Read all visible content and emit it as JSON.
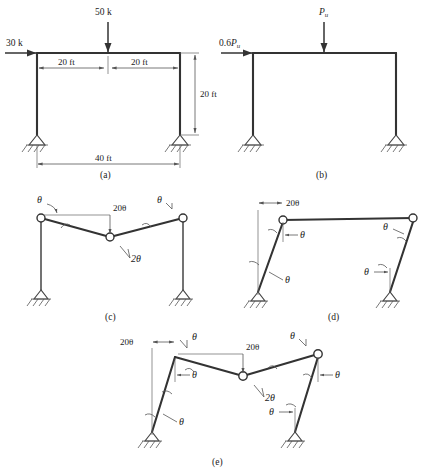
{
  "figure": {
    "background_color": "#ffffff",
    "line_color": "#333333",
    "panels": [
      {
        "id": "a",
        "caption": "(a)",
        "description": "Portal frame with factored service loads",
        "loads": [
          {
            "name": "horizontal-load",
            "label": "30 k",
            "direction": "right"
          },
          {
            "name": "vertical-load",
            "label": "50 k",
            "direction": "down"
          }
        ],
        "dimensions": [
          {
            "name": "left-span",
            "label": "20 ft"
          },
          {
            "name": "right-span",
            "label": "20 ft"
          },
          {
            "name": "column-height",
            "label": "20 ft"
          },
          {
            "name": "total-span",
            "label": "40 ft"
          }
        ],
        "supports": [
          "pinned",
          "pinned"
        ]
      },
      {
        "id": "b",
        "caption": "(b)",
        "description": "Portal frame with ultimate load Pu",
        "loads": [
          {
            "name": "horizontal-load",
            "label_prefix": "0.6",
            "label_symbol": "P",
            "label_sub": "u",
            "direction": "right"
          },
          {
            "name": "vertical-load",
            "label_prefix": "",
            "label_symbol": "P",
            "label_sub": "u",
            "direction": "down"
          }
        ],
        "supports": [
          "pinned",
          "pinned"
        ]
      },
      {
        "id": "c",
        "caption": "(c)",
        "description": "Beam mechanism",
        "angles": [
          {
            "name": "beam-left-rotation",
            "label": "θ"
          },
          {
            "name": "beam-displacement",
            "label": "20θ"
          },
          {
            "name": "beam-right-rotation",
            "label": "θ"
          },
          {
            "name": "beam-center-rotation",
            "label": "2θ"
          }
        ],
        "supports": [
          "pinned",
          "pinned"
        ]
      },
      {
        "id": "d",
        "caption": "(d)",
        "description": "Sway mechanism",
        "angles": [
          {
            "name": "sway-displacement",
            "label": "20θ"
          },
          {
            "name": "left-top-rotation",
            "label": "θ"
          },
          {
            "name": "left-base-rotation",
            "label": "θ"
          },
          {
            "name": "right-top-rotation",
            "label": "θ"
          },
          {
            "name": "right-base-rotation",
            "label": "θ"
          }
        ],
        "supports": [
          "pinned",
          "pinned"
        ]
      },
      {
        "id": "e",
        "caption": "(e)",
        "description": "Combined mechanism",
        "angles": [
          {
            "name": "sway-displacement",
            "label": "20θ"
          },
          {
            "name": "left-joint-rotation",
            "label": "θ"
          },
          {
            "name": "left-column-rotation",
            "label": "θ"
          },
          {
            "name": "left-base-rotation",
            "label": "θ"
          },
          {
            "name": "beam-displacement",
            "label": "20θ"
          },
          {
            "name": "beam-center-rotation",
            "label": "2θ"
          },
          {
            "name": "right-joint-rotation",
            "label": "θ"
          },
          {
            "name": "right-column-rotation",
            "label": "θ"
          },
          {
            "name": "right-base-rotation",
            "label": "θ"
          }
        ],
        "supports": [
          "pinned",
          "pinned"
        ]
      }
    ]
  }
}
